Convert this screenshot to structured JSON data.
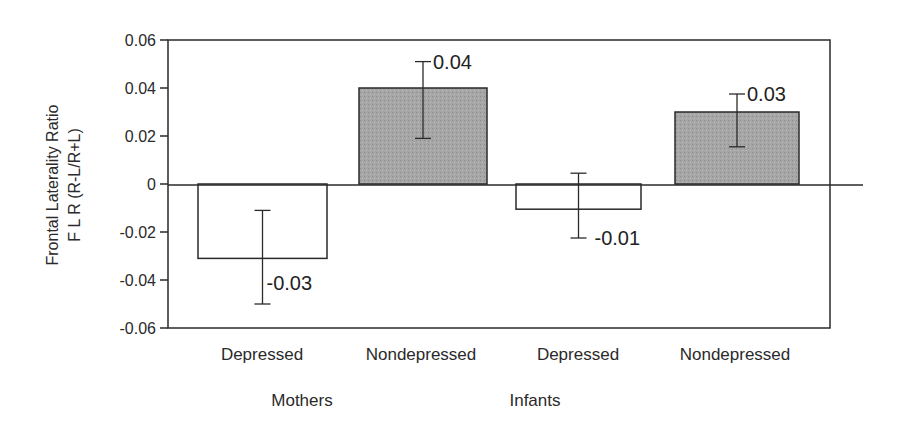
{
  "chart_data": {
    "type": "bar",
    "title": "",
    "xlabel": "",
    "ylabel": "Frontal Laterality Ratio F L R (R-L/R+L)",
    "ylabel_lines": [
      "Frontal Laterality Ratio",
      "F L R (R-L/R+L)"
    ],
    "ylim": [
      -0.06,
      0.06
    ],
    "yticks": [
      "0.06",
      "0.04",
      "0.02",
      "0",
      "-0.02",
      "-0.04",
      "-0.06"
    ],
    "groups": [
      "Mothers",
      "Infants"
    ],
    "categories": [
      "Depressed",
      "Nondepressed",
      "Depressed",
      "Nondepressed"
    ],
    "group_of_category": [
      "Mothers",
      "Mothers",
      "Infants",
      "Infants"
    ],
    "values": [
      -0.031,
      0.04,
      -0.0105,
      0.03
    ],
    "value_labels": [
      "-0.03",
      "0.04",
      "-0.01",
      "0.03"
    ],
    "error_bars": [
      {
        "low": -0.05,
        "high": -0.011
      },
      {
        "low": 0.019,
        "high": 0.051
      },
      {
        "low": -0.0225,
        "high": 0.0045
      },
      {
        "low": 0.0155,
        "high": 0.0375
      }
    ],
    "fill_colors": [
      "#ffffff",
      "#a9a9a9",
      "#ffffff",
      "#a9a9a9"
    ],
    "grid": false,
    "legend": null
  }
}
